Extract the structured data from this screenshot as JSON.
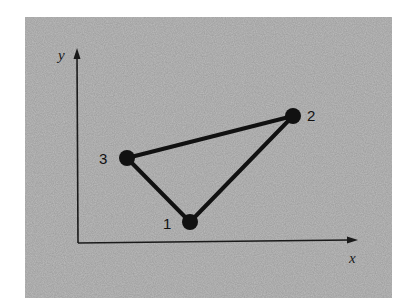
{
  "figure": {
    "background_color": "#bdbdbd",
    "ink_color": "#111111",
    "axes": {
      "x_label": "x",
      "y_label": "y",
      "origin": [
        78,
        243
      ],
      "x_end": [
        358,
        240
      ],
      "y_end": [
        77,
        48
      ]
    },
    "vertices": [
      {
        "id": "1",
        "label": "1",
        "cx": 190,
        "cy": 222,
        "label_x": 163,
        "label_y": 229
      },
      {
        "id": "2",
        "label": "2",
        "cx": 293,
        "cy": 116,
        "label_x": 307,
        "label_y": 121
      },
      {
        "id": "3",
        "label": "3",
        "cx": 127,
        "cy": 158,
        "label_x": 99,
        "label_y": 164
      }
    ],
    "edges": [
      {
        "from": "1",
        "to": "2"
      },
      {
        "from": "2",
        "to": "3"
      },
      {
        "from": "3",
        "to": "1"
      }
    ]
  }
}
